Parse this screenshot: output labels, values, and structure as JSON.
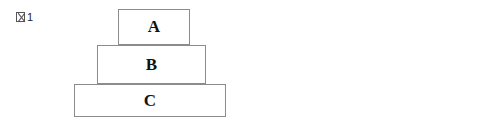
{
  "figures": [
    {
      "id": "figure-1",
      "label_text": "1",
      "label_prefix_icon": "tofu-glyph-zu",
      "label_full": "図1",
      "label_x": 16,
      "label_y": 11,
      "blocks": [
        {
          "name": "A",
          "x": 118,
          "y": 9,
          "w": 72,
          "h": 36
        },
        {
          "name": "B",
          "x": 97,
          "y": 45,
          "w": 109,
          "h": 39
        },
        {
          "name": "C",
          "x": 74,
          "y": 84,
          "w": 152,
          "h": 33
        }
      ],
      "force_region": null,
      "arrows": []
    },
    {
      "id": "figure-2",
      "label_text": "2",
      "label_prefix_icon": "tofu-glyph-zu",
      "label_full": "図2",
      "label_x": 298,
      "label_y": 11,
      "blocks": [
        {
          "name": "A",
          "x": 388,
          "y": 9,
          "w": 67,
          "h": 36
        },
        {
          "name": "B",
          "x": 367,
          "y": 45,
          "w": 109,
          "h": 39
        },
        {
          "name": "C",
          "x": 388,
          "y": 84,
          "w": 67,
          "h": 33
        }
      ],
      "force_region": {
        "x": 338,
        "y": 84,
        "w": 160,
        "h": 33
      },
      "arrows": [
        {
          "direction": "right",
          "x": 345,
          "y": 92,
          "w": 44
        },
        {
          "direction": "left",
          "x": 454,
          "y": 92,
          "w": 44
        }
      ]
    }
  ],
  "colors": {
    "block_border": "#8c8c8c",
    "block_fill": "#ffffff",
    "arrow": "#000000",
    "dashed_border": "#6b6b6b",
    "text": "#111111",
    "background": "#ffffff"
  }
}
